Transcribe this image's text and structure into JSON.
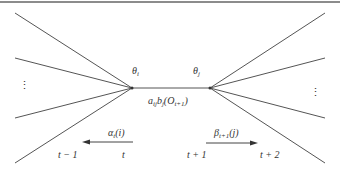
{
  "diagram": {
    "type": "hmm-trellis-transition",
    "colors": {
      "line": "#555555",
      "text": "#333333",
      "border": "#666666",
      "background": "#ffffff"
    },
    "left_node": {
      "label": "θ",
      "subscript": "i",
      "x": 132,
      "y": 88
    },
    "right_node": {
      "label": "θ",
      "subscript": "j",
      "x": 210,
      "y": 88
    },
    "edge_label": {
      "prefix": "a",
      "a_sub": "ij",
      "b": "b",
      "b_sub": "j",
      "obs": "O",
      "obs_sub": "t+1"
    },
    "left_fan_y": [
      13,
      58,
      118,
      163
    ],
    "right_fan_y": [
      13,
      58,
      118,
      163
    ],
    "ellipsis": "⋮",
    "alpha": {
      "symbol": "α",
      "sub": "t",
      "arg": "(i)"
    },
    "beta": {
      "symbol": "β",
      "sub": "t+1",
      "arg": "(j)"
    },
    "time_labels": {
      "t_minus_1": "t − 1",
      "t": "t",
      "t_plus_1": "t + 1",
      "t_plus_2": "t + 2"
    }
  }
}
